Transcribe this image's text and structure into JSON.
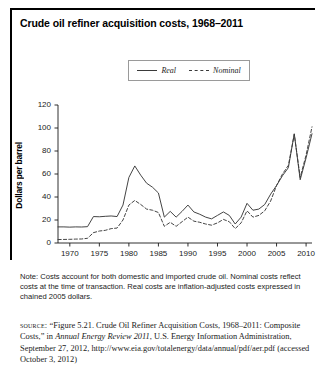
{
  "figure": {
    "title": "Crude oil refiner acquisition costs, 1968–2011",
    "note": "Note: Costs account for both domestic and imported crude oil. Nominal costs reflect costs at the time of transaction. Real costs are inflation-adjusted costs expressed in chained 2005 dollars.",
    "source": {
      "label": "source:",
      "part1": "“Figure 5.21. Crude Oil Refiner Acquisition Costs, 1968–2011: Composite Costs,” in ",
      "italic": "Annual Energy Review 2011",
      "part2": ", U.S. Energy Information Administration, September 27, 2012, http://www.eia.gov/totalenergy/data/annual/pdf/aer.pdf (accessed October 3, 2012)"
    }
  },
  "legend": {
    "real": "Real",
    "nominal": "Nominal"
  },
  "chart_data": {
    "type": "line",
    "title": "Crude oil refiner acquisition costs, 1968–2011",
    "xlabel": "",
    "ylabel": "Dollars per barrel",
    "xlim": [
      1968,
      2011
    ],
    "ylim": [
      0,
      120
    ],
    "grid": false,
    "legend_position": "top-center",
    "xticks": [
      1970,
      1975,
      1980,
      1985,
      1990,
      1995,
      2000,
      2005,
      2010
    ],
    "yticks": [
      0,
      20,
      40,
      60,
      80,
      100,
      120
    ],
    "x": [
      1968,
      1969,
      1970,
      1971,
      1972,
      1973,
      1974,
      1975,
      1976,
      1977,
      1978,
      1979,
      1980,
      1981,
      1982,
      1983,
      1984,
      1985,
      1986,
      1987,
      1988,
      1989,
      1990,
      1991,
      1992,
      1993,
      1994,
      1995,
      1996,
      1997,
      1998,
      1999,
      2000,
      2001,
      2002,
      2003,
      2004,
      2005,
      2006,
      2007,
      2008,
      2009,
      2010,
      2011
    ],
    "series": [
      {
        "name": "Real",
        "style": "solid",
        "values": [
          14.0,
          14.0,
          13.8,
          14.0,
          13.9,
          14.2,
          23.0,
          22.8,
          23.2,
          23.5,
          23.0,
          33.0,
          57.0,
          67.0,
          59.0,
          52.0,
          48.5,
          43.5,
          22.5,
          27.5,
          22.5,
          27.5,
          33.0,
          27.0,
          25.0,
          22.5,
          21.0,
          24.0,
          27.0,
          24.0,
          16.5,
          22.5,
          34.5,
          28.5,
          29.5,
          33.5,
          42.5,
          50.0,
          58.5,
          65.5,
          95.0,
          55.0,
          74.0,
          95.0
        ]
      },
      {
        "name": "Nominal",
        "style": "dashed",
        "values": [
          3.0,
          3.1,
          3.2,
          3.4,
          3.5,
          4.1,
          9.0,
          10.4,
          11.0,
          12.5,
          13.0,
          20.0,
          33.0,
          37.0,
          33.5,
          29.5,
          28.5,
          26.5,
          14.5,
          18.0,
          14.5,
          18.5,
          22.5,
          19.0,
          18.0,
          16.5,
          15.5,
          17.5,
          20.5,
          18.5,
          12.5,
          17.5,
          28.0,
          22.5,
          24.0,
          28.0,
          36.5,
          50.0,
          60.0,
          67.5,
          94.5,
          57.0,
          76.5,
          101.0
        ]
      }
    ]
  }
}
